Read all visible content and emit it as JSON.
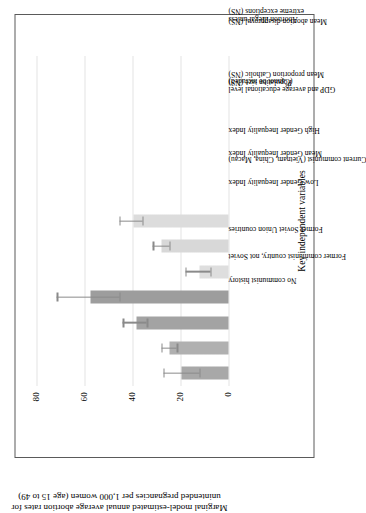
{
  "chart_data": {
    "type": "bar",
    "title": "",
    "orientation": "vertical",
    "xlabel": "Key independent variables",
    "ylabel": "Marginal model-estimated annual average abortion rates for unintended pregnancies per 1,000 women (age 15 to 49)",
    "ylim": [
      0,
      90
    ],
    "yticks": [
      0,
      20,
      40,
      60,
      80
    ],
    "ytick_labels": [
      "0",
      "20",
      "40",
      "60",
      "80"
    ],
    "grid": true,
    "grid_axis": "y",
    "legend": false,
    "error_bars": "95% confidence intervals",
    "categories": [
      "Former communist country, not Soviet",
      "No communist history",
      "Former Soviet Union countries",
      "Current communist (Vietnam, China, Macau)",
      "Low Gender Inequality Index",
      "Mean Gender Inequality Index",
      "High Gender Inequality Index",
      "GDP and average educational level (Cannot be included)",
      "Mean proportion Catholic (NS)",
      "Population size (NS)",
      "Mean abortion disapproval (NS)",
      "Abortion illegal unless extreme exceptions (NS)",
      "Mean religious importance (NS)"
    ],
    "category_lines": [
      [
        "Former communist country, not Soviet"
      ],
      [
        "No communist history"
      ],
      [
        "Former Soviet Union countries"
      ],
      [
        "Current communist (Vietnam, China, Macau)"
      ],
      [
        "Low Gender Inequality Index"
      ],
      [
        "Mean Gender Inequality Index"
      ],
      [
        "High Gender Inequality Index"
      ],
      [
        "GDP and average educational level",
        "(Cannot be included)"
      ],
      [
        "Mean proportion Catholic (NS)"
      ],
      [
        "Population size (NS)"
      ],
      [
        "Mean abortion disapproval (NS)"
      ],
      [
        "Abortion illegal unless",
        "extreme exceptions (NS)"
      ],
      [
        "Mean religious importance (NS)"
      ]
    ],
    "values": [
      19.5,
      24.5,
      38.5,
      57.5,
      12.0,
      28.0,
      39.5,
      null,
      null,
      null,
      null,
      null,
      null
    ],
    "err_low": [
      12.0,
      21.5,
      34.0,
      45.5,
      7.5,
      24.5,
      36.0,
      null,
      null,
      null,
      null,
      null,
      null
    ],
    "err_high": [
      27.0,
      28.0,
      44.0,
      71.5,
      18.0,
      31.5,
      45.5,
      null,
      null,
      null,
      null,
      null,
      null
    ],
    "bar_colors": [
      "#a8a8a8",
      "#b0b0b0",
      "#a3a3a3",
      "#9d9d9d",
      "#dedede",
      "#d8d8d8",
      "#dcdcdc",
      null,
      null,
      null,
      null,
      null,
      null
    ],
    "error_bar_color": "#8a8a8a",
    "grid_color": "#e4e4e4",
    "frame_color": "#5a5a5a",
    "text_color": "#000000",
    "background": "#ffffff"
  }
}
